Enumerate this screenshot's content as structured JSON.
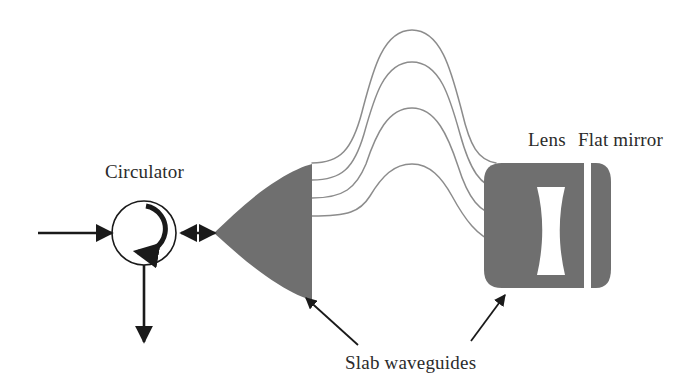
{
  "figure": {
    "type": "optical-system-schematic",
    "background_color": "#ffffff",
    "slab_fill_color": "#6f6f6f",
    "line_color": "#1a1a1a",
    "waveguide_color": "#8c8c8c",
    "label_color": "#2b2b2b"
  },
  "labels": {
    "circulator": "Circulator",
    "lens": "Lens",
    "flat_mirror": "Flat mirror",
    "slab_waveguides": "Slab waveguides"
  },
  "components": {
    "circulator": {
      "name": "Circulator",
      "shape": "circle",
      "center_x": 144,
      "center_y": 233,
      "radius": 32,
      "internal_arrow": "clockwise-circulation-arrow"
    },
    "input_port": {
      "name": "input-signal-arrow",
      "direction": "right",
      "from_x": 38,
      "to_x": 112,
      "y": 233
    },
    "output_port": {
      "name": "output-signal-arrow",
      "direction": "down",
      "x": 144,
      "from_y": 266,
      "to_y": 342
    },
    "coupling_link": {
      "name": "bidirectional-coupling-arrow",
      "direction": "both",
      "from_x": 180,
      "to_x": 216,
      "y": 233
    },
    "slab_waveguide_left": {
      "name": "left-slab-waveguide",
      "shape": "wedge-triangle-pointing-left",
      "tip_x": 214,
      "tip_y": 233,
      "flat_edge_x": 312,
      "top_y": 165,
      "bottom_y": 295
    },
    "slab_waveguide_right": {
      "name": "right-slab-waveguide-block",
      "shape": "rounded-rectangle",
      "x": 484,
      "y": 163,
      "width": 100,
      "height": 125
    },
    "lens": {
      "name": "biconcave-lens-cutout",
      "shape": "biconcave",
      "fill": "#ffffff",
      "center_x": 551,
      "top_y": 187,
      "bottom_y": 275
    },
    "flat_mirror": {
      "name": "flat-mirror-strip",
      "shape": "vertical-strip-rounded-right",
      "x": 591,
      "y": 163,
      "width": 20,
      "height": 125
    },
    "array_waveguides": {
      "name": "arrayed-waveguide-curves",
      "count": 4,
      "description": "four nested arched waveguides connecting the two slabs",
      "peak_heights_y": [
        30,
        62,
        108,
        164
      ]
    }
  },
  "callouts": [
    {
      "name": "slab-waveguides-callout-left",
      "tip_x": 307,
      "tip_y": 299,
      "tail_x": 356,
      "tail_y": 344
    },
    {
      "name": "slab-waveguides-callout-right",
      "tip_x": 504,
      "tip_y": 296,
      "tail_x": 473,
      "tail_y": 340
    }
  ],
  "label_positions": {
    "circulator": {
      "x": 105,
      "y": 178
    },
    "lens": {
      "x": 528,
      "y": 146
    },
    "flat_mirror": {
      "x": 578,
      "y": 146
    },
    "slab_waveguides": {
      "x": 345,
      "y": 368
    }
  }
}
